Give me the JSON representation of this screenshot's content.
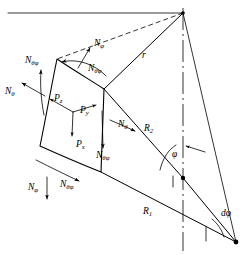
{
  "figure": {
    "colors": {
      "line": "#000000",
      "background": "#ffffff"
    }
  },
  "labels": {
    "n_theta_phi_top_left": {
      "base": "N",
      "sub": "θφ"
    },
    "n_theta_left": {
      "base": "N",
      "sub": "θ"
    },
    "n_phi_top": {
      "base": "N",
      "sub": "φ"
    },
    "n_theta_phi_top_inner": {
      "base": "N",
      "sub": "θφ"
    },
    "p_z": {
      "base": "P",
      "sub": "z"
    },
    "p_y": {
      "base": "P",
      "sub": "y"
    },
    "p_x": {
      "base": "P",
      "sub": "x"
    },
    "n_theta_right": {
      "base": "N",
      "sub": "θ"
    },
    "n_theta_phi_right": {
      "base": "N",
      "sub": "θφ"
    },
    "n_phi_bottom": {
      "base": "N",
      "sub": "φ"
    },
    "n_theta_phi_bottom": {
      "base": "N",
      "sub": "θφ"
    },
    "radius_r": {
      "base": "r",
      "sub": ""
    },
    "radius_r2": {
      "base": "R",
      "sub": "2"
    },
    "radius_r1": {
      "base": "R",
      "sub": "1"
    },
    "angle_phi": {
      "base": "φ",
      "sub": ""
    },
    "angle_dphi": {
      "base": "dφ",
      "sub": ""
    }
  },
  "geometry": {
    "apex": {
      "x": 183,
      "y": 13
    },
    "axis_top": {
      "x": 183,
      "y": 13
    },
    "axis_bottom": {
      "x": 183,
      "y": 250
    },
    "center_r2": {
      "x": 183,
      "y": 178
    },
    "center_r1": {
      "x": 236,
      "y": 242
    },
    "element_corners": {
      "top_left": {
        "x": 57,
        "y": 59
      },
      "top_right": {
        "x": 104,
        "y": 89
      },
      "bottom_right": {
        "x": 101,
        "y": 172
      },
      "bottom_left": {
        "x": 40,
        "y": 146
      }
    }
  }
}
